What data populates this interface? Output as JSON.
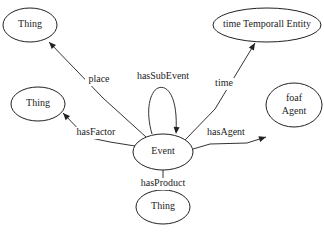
{
  "diagram": {
    "type": "ontology-graph",
    "nodes": [
      {
        "id": "event",
        "lines": [
          "Event"
        ]
      },
      {
        "id": "thing_place",
        "lines": [
          "Thing"
        ]
      },
      {
        "id": "time_entity",
        "lines": [
          "time Temporall Entity"
        ]
      },
      {
        "id": "thing_factor",
        "lines": [
          "Thing"
        ]
      },
      {
        "id": "foaf_agent",
        "lines": [
          "foaf",
          "Agent"
        ]
      },
      {
        "id": "thing_product",
        "lines": [
          "Thing"
        ]
      }
    ],
    "edges": [
      {
        "from": "event",
        "to": "thing_place",
        "label": "place"
      },
      {
        "from": "event",
        "to": "event",
        "label": "hasSubEvent"
      },
      {
        "from": "event",
        "to": "time_entity",
        "label": "time"
      },
      {
        "from": "event",
        "to": "thing_factor",
        "label": "hasFactor"
      },
      {
        "from": "event",
        "to": "foaf_agent",
        "label": "hasAgent"
      },
      {
        "from": "event",
        "to": "thing_product",
        "label": "hasProduct"
      }
    ]
  }
}
